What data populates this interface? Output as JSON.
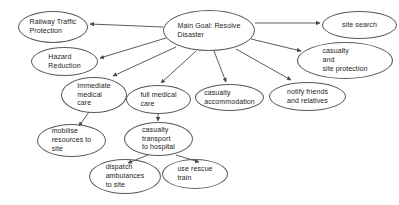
{
  "diagram": {
    "type": "goal-tree",
    "background_color": "#ffffff",
    "node_stroke_color": "#5a5a5a",
    "edge_color": "#4a4a4a",
    "text_color": "#1c1c1c",
    "nodes": [
      {
        "id": "main-goal",
        "label": "Main Goal: Resolve\nDisaster",
        "x": 163,
        "y": 10,
        "w": 92,
        "h": 41,
        "align": "left"
      },
      {
        "id": "railway-traffic-protection",
        "label": "Railway Traffic\nProtection",
        "x": 18,
        "y": 11,
        "w": 70,
        "h": 32,
        "align": "left"
      },
      {
        "id": "hazard-reduction",
        "label": "Hazard\nReduction",
        "x": 31,
        "y": 47,
        "w": 67,
        "h": 29,
        "align": "left"
      },
      {
        "id": "site-search",
        "label": "site search",
        "x": 322,
        "y": 11,
        "w": 75,
        "h": 28,
        "align": "center"
      },
      {
        "id": "casualty-and-site-protection",
        "label": "casualty\nand\nsite protection",
        "x": 297,
        "y": 42,
        "w": 96,
        "h": 37,
        "align": "left"
      },
      {
        "id": "notify-friends-and-relatives",
        "label": "notify friends\nand relatives",
        "x": 269,
        "y": 82,
        "w": 77,
        "h": 29,
        "align": "left"
      },
      {
        "id": "casualty-accommodation",
        "label": "casualty\naccommodation",
        "x": 195,
        "y": 84,
        "w": 69,
        "h": 27,
        "align": "left"
      },
      {
        "id": "immediate-medical-care",
        "label": "Immediate\nmedical\ncare",
        "x": 61,
        "y": 77,
        "w": 66,
        "h": 36,
        "align": "left"
      },
      {
        "id": "full-medical-care",
        "label": "full medical\ncare",
        "x": 126,
        "y": 85,
        "w": 65,
        "h": 29,
        "align": "left"
      },
      {
        "id": "mobilise-resources-to-site",
        "label": "mobilise\nresources to\nsite",
        "x": 37,
        "y": 124,
        "w": 69,
        "h": 33,
        "align": "left"
      },
      {
        "id": "casualty-transport-to-hospital",
        "label": "casualty\ntransport\nto hospital",
        "x": 124,
        "y": 122,
        "w": 69,
        "h": 34,
        "align": "left"
      },
      {
        "id": "dispatch-ambulances-to-site",
        "label": "dispatch\nambulances\nto site",
        "x": 89,
        "y": 159,
        "w": 72,
        "h": 35,
        "align": "left"
      },
      {
        "id": "use-rescue-train",
        "label": "use rescue\ntrain",
        "x": 162,
        "y": 159,
        "w": 66,
        "h": 30,
        "align": "left"
      }
    ],
    "edges": [
      {
        "from": "main-goal",
        "to": "railway-traffic-protection",
        "x1": 163,
        "y1": 27,
        "x2": 90,
        "y2": 24
      },
      {
        "from": "main-goal",
        "to": "hazard-reduction",
        "x1": 166,
        "y1": 38,
        "x2": 100,
        "y2": 58
      },
      {
        "from": "main-goal",
        "to": "immediate-medical-care",
        "x1": 176,
        "y1": 47,
        "x2": 113,
        "y2": 76
      },
      {
        "from": "main-goal",
        "to": "full-medical-care",
        "x1": 196,
        "y1": 51,
        "x2": 161,
        "y2": 83
      },
      {
        "from": "main-goal",
        "to": "casualty-accommodation",
        "x1": 214,
        "y1": 51,
        "x2": 226,
        "y2": 82
      },
      {
        "from": "main-goal",
        "to": "notify-friends-and-relatives",
        "x1": 236,
        "y1": 49,
        "x2": 291,
        "y2": 80
      },
      {
        "from": "main-goal",
        "to": "casualty-and-site-protection",
        "x1": 251,
        "y1": 39,
        "x2": 301,
        "y2": 51
      },
      {
        "from": "main-goal",
        "to": "site-search",
        "x1": 255,
        "y1": 23,
        "x2": 320,
        "y2": 23
      },
      {
        "from": "immediate-medical-care",
        "to": "mobilise-resources-to-site",
        "x1": 89,
        "y1": 112,
        "x2": 79,
        "y2": 126
      },
      {
        "from": "full-medical-care",
        "to": "casualty-transport-to-hospital",
        "x1": 158,
        "y1": 114,
        "x2": 158,
        "y2": 121
      },
      {
        "from": "casualty-transport-to-hospital",
        "to": "dispatch-ambulances-to-site",
        "x1": 148,
        "y1": 155,
        "x2": 128,
        "y2": 163
      },
      {
        "from": "casualty-transport-to-hospital",
        "to": "use-rescue-train",
        "x1": 176,
        "y1": 155,
        "x2": 199,
        "y2": 162
      }
    ]
  }
}
